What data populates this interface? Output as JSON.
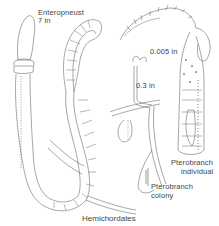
{
  "figure": {
    "caption": "Hemichordates",
    "labels": {
      "enteropneust_name": "Enteropneust",
      "enteropneust_size": "7 in",
      "pterobranch_individual_size": "0.005 in",
      "pterobranch_colony_size": "0.3 in",
      "pterobranch_individual_line1": "Pterobranch",
      "pterobranch_individual_line2": "individual",
      "pterobranch_colony_line1": "Pterobranch",
      "pterobranch_colony_line2": "colony"
    },
    "colors": {
      "line": "#6b6b6b",
      "text": "#444444",
      "background": "#ffffff"
    }
  }
}
